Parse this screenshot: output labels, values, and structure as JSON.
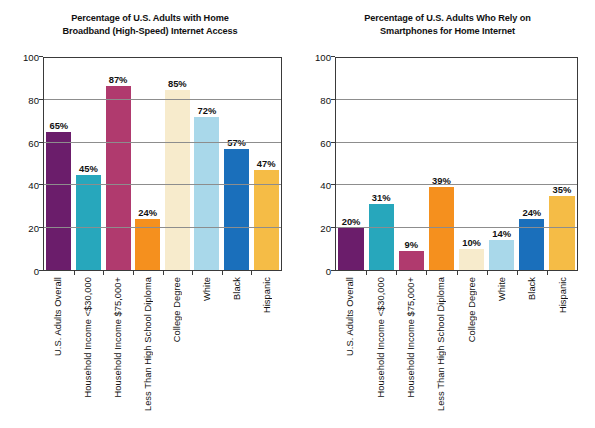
{
  "chart_data": [
    {
      "type": "bar",
      "title": "Percentage of U.S. Adults with Home Broadband (High-Speed) Internet Access",
      "title_lines": [
        "Percentage of U.S. Adults with Home",
        "Broadband (High-Speed) Internet Access"
      ],
      "xlabel": "",
      "ylabel": "",
      "ylim": [
        0,
        100
      ],
      "yticks": [
        0,
        20,
        40,
        60,
        80,
        100
      ],
      "ytick_labels": [
        "0",
        "20",
        "40",
        "60",
        "80",
        "100"
      ],
      "grid": "horizontal",
      "legend": "none",
      "categories": [
        "U.S. Adults Overall",
        "Household Income <$30,000",
        "Household Income $75,000+",
        "Less Than High School Diploma",
        "College Degree",
        "White",
        "Black",
        "Hispanic"
      ],
      "values": [
        65,
        45,
        87,
        24,
        85,
        72,
        57,
        47
      ],
      "data_labels": [
        "65%",
        "45%",
        "87%",
        "24%",
        "85%",
        "72%",
        "57%",
        "47%"
      ],
      "colors": [
        "#6B1D6B",
        "#27A7BC",
        "#B03A6E",
        "#F5901E",
        "#F7EBCC",
        "#A9D8EA",
        "#1A6FBB",
        "#F5BC46"
      ]
    },
    {
      "type": "bar",
      "title": "Percentage of U.S. Adults Who Rely on Smartphones for Home Internet",
      "title_lines": [
        "Percentage of U.S. Adults Who Rely on",
        "Smartphones for Home Internet"
      ],
      "xlabel": "",
      "ylabel": "",
      "ylim": [
        0,
        100
      ],
      "yticks": [
        0,
        20,
        40,
        60,
        80,
        100
      ],
      "ytick_labels": [
        "0",
        "20",
        "40",
        "60",
        "80",
        "100"
      ],
      "grid": "horizontal",
      "legend": "none",
      "categories": [
        "U.S. Adults Overall",
        "Household Income <$30,000",
        "Household Income $75,000+",
        "Less Than High School Diploma",
        "College Degree",
        "White",
        "Black",
        "Hispanic"
      ],
      "values": [
        20,
        31,
        9,
        39,
        10,
        14,
        24,
        35
      ],
      "data_labels": [
        "20%",
        "31%",
        "9%",
        "39%",
        "10%",
        "14%",
        "24%",
        "35%"
      ],
      "colors": [
        "#6B1D6B",
        "#27A7BC",
        "#B03A6E",
        "#F5901E",
        "#F7EBCC",
        "#A9D8EA",
        "#1A6FBB",
        "#F5BC46"
      ]
    }
  ],
  "figure": {
    "background": "#ffffff",
    "axis_color": "#3a3a3a",
    "grid_color": "#8d8d8d",
    "text_color": "#111111"
  }
}
